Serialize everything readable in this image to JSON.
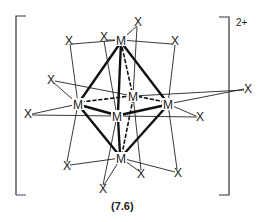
{
  "diagram": {
    "label": "(7.6)",
    "charge": "2+",
    "metal_symbol": "M",
    "ligand_symbol": "X",
    "colors": {
      "ink": "#1a1a1a",
      "bracket_bottom_left": "#5a5aa0"
    },
    "metals": [
      {
        "id": "m_top",
        "x": 121,
        "y": 40
      },
      {
        "id": "m_left",
        "x": 78,
        "y": 104
      },
      {
        "id": "m_back",
        "x": 133,
        "y": 96
      },
      {
        "id": "m_right",
        "x": 168,
        "y": 104
      },
      {
        "id": "m_front",
        "x": 117,
        "y": 116
      },
      {
        "id": "m_bottom",
        "x": 121,
        "y": 158
      }
    ],
    "ligands": [
      {
        "id": "x1",
        "x": 69,
        "y": 41
      },
      {
        "id": "x2",
        "x": 104,
        "y": 37
      },
      {
        "id": "x3",
        "x": 138,
        "y": 22
      },
      {
        "id": "x4",
        "x": 175,
        "y": 41
      },
      {
        "id": "x5",
        "x": 51,
        "y": 80
      },
      {
        "id": "x6",
        "x": 248,
        "y": 89
      },
      {
        "id": "x7",
        "x": 28,
        "y": 114
      },
      {
        "id": "x8",
        "x": 200,
        "y": 117
      },
      {
        "id": "x9",
        "x": 67,
        "y": 166
      },
      {
        "id": "x10",
        "x": 178,
        "y": 173
      },
      {
        "id": "x11",
        "x": 141,
        "y": 174
      },
      {
        "id": "x12",
        "x": 103,
        "y": 189
      }
    ]
  }
}
